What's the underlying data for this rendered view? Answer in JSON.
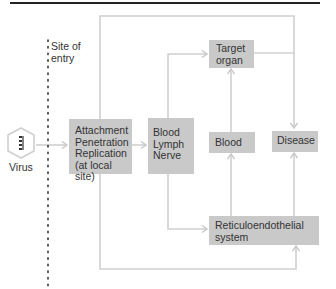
{
  "diagram": {
    "title": "",
    "site_of_entry": {
      "line1": "Site of",
      "line2": "entry"
    },
    "virus_label": "Virus",
    "nodes": {
      "local": {
        "lines": [
          "Attachment",
          "Penetration",
          "Replication",
          "(at local site)"
        ]
      },
      "routes": {
        "lines": [
          "Blood",
          "Lymph",
          "Nerve"
        ]
      },
      "target": {
        "lines": [
          "Target",
          "organ"
        ]
      },
      "blood": {
        "lines": [
          "Blood"
        ]
      },
      "disease": {
        "lines": [
          "Disease"
        ]
      },
      "res": {
        "lines": [
          "Reticuloendothelial",
          "system"
        ]
      }
    },
    "edges": [
      {
        "from": "virus",
        "to": "local"
      },
      {
        "from": "local",
        "to": "routes"
      },
      {
        "from": "routes",
        "to": "target"
      },
      {
        "from": "routes",
        "to": "res"
      },
      {
        "from": "local",
        "to": "disease",
        "via": "outer-top-loop"
      },
      {
        "from": "local",
        "to": "res",
        "via": "outer-bottom-loop"
      },
      {
        "from": "target",
        "to": "disease"
      },
      {
        "from": "blood",
        "to": "target"
      },
      {
        "from": "res",
        "to": "blood"
      },
      {
        "from": "res",
        "to": "disease"
      }
    ],
    "colors": {
      "box": "#c9c9c9",
      "line": "#cfcfcf",
      "rule": "#222222",
      "text": "#333333"
    }
  }
}
